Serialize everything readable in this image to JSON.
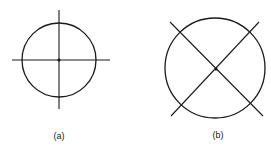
{
  "figures": [
    {
      "id": "a",
      "label": "(a)",
      "description": "circle with horizontal and vertical crosshair lines through center"
    },
    {
      "id": "b",
      "label": "(b)",
      "description": "circle with diagonal crosshair lines through center"
    }
  ],
  "colors": {
    "stroke": "#1a1a1a",
    "background": "#ffffff"
  }
}
